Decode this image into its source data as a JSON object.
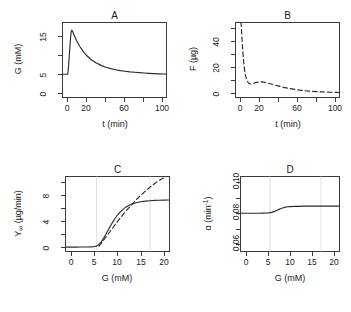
{
  "figure": {
    "label": "four-panel-simulation-figure",
    "panels_order": [
      "A",
      "B",
      "C",
      "D"
    ]
  },
  "chart_data": [
    {
      "panel": "A",
      "type": "line",
      "title": "A",
      "xlabel": "t (min)",
      "ylabel": "G (mM)",
      "xlim": [
        -6,
        104
      ],
      "ylim": [
        -1.2,
        18.6
      ],
      "xticks": [
        0,
        20,
        40,
        60,
        80,
        100
      ],
      "xticklabels": [
        "0",
        "20",
        "",
        "60",
        "",
        "100"
      ],
      "yticks": [
        0,
        5,
        10,
        15
      ],
      "yticklabels": [
        "0",
        "5",
        "",
        "15"
      ],
      "grid": false,
      "legend": "none",
      "series": [
        {
          "name": "G(t)",
          "style": "solid",
          "x": [
            -6,
            -1,
            0,
            1,
            2,
            3,
            3.6,
            4.2,
            5,
            6,
            8,
            10,
            13,
            16,
            20,
            25,
            30,
            35,
            40,
            45,
            50,
            55,
            60,
            65,
            70,
            75,
            80,
            85,
            90,
            95,
            100,
            103
          ],
          "y": [
            5.0,
            5.0,
            5.0,
            7.4,
            11.2,
            14.6,
            16.0,
            16.5,
            16.2,
            15.6,
            14.4,
            13.4,
            12.1,
            11.0,
            9.8,
            8.7,
            7.9,
            7.3,
            6.8,
            6.45,
            6.15,
            5.95,
            5.78,
            5.62,
            5.5,
            5.4,
            5.3,
            5.22,
            5.16,
            5.1,
            5.05,
            5.02
          ]
        }
      ]
    },
    {
      "panel": "B",
      "type": "line",
      "title": "B",
      "xlabel": "t (min)",
      "ylabel": "F (µg)",
      "xlim": [
        -6,
        104
      ],
      "ylim": [
        -4,
        58
      ],
      "xticks": [
        0,
        20,
        40,
        60,
        80,
        100
      ],
      "xticklabels": [
        "0",
        "20",
        "",
        "60",
        "",
        "100"
      ],
      "yticks": [
        0,
        10,
        20,
        30,
        40,
        50
      ],
      "yticklabels": [
        "0",
        "",
        "20",
        "",
        "40",
        ""
      ],
      "grid": false,
      "legend": "none",
      "note": "curve enters from above the top of the axis range",
      "series": [
        {
          "name": "F(t)",
          "style": "dashed",
          "x": [
            0.2,
            0.6,
            1.2,
            2,
            3,
            4,
            5,
            6,
            7,
            8,
            9,
            10,
            12,
            14,
            17,
            20,
            22,
            25,
            28,
            32,
            36,
            40,
            45,
            50,
            55,
            60,
            65,
            70,
            75,
            80,
            85,
            90,
            95,
            100,
            103
          ],
          "y": [
            58,
            54,
            46,
            36,
            26,
            19,
            14.5,
            11.5,
            9.6,
            8.4,
            7.7,
            7.4,
            7.6,
            8.1,
            8.8,
            9.1,
            9.1,
            8.8,
            8.3,
            7.4,
            6.5,
            5.7,
            4.7,
            3.9,
            3.2,
            2.6,
            2.1,
            1.7,
            1.4,
            1.15,
            0.95,
            0.8,
            0.65,
            0.55,
            0.5
          ]
        }
      ]
    },
    {
      "panel": "C",
      "type": "line",
      "title": "C",
      "xlabel": "G (mM)",
      "ylabel": "Y∞ (µg/min)",
      "ylabel_parts": {
        "base": "Y",
        "sub": "∞",
        "unit": " (µg/min)"
      },
      "xlim": [
        -1.3,
        21.3
      ],
      "ylim": [
        -0.7,
        10.9
      ],
      "xticks": [
        0,
        5,
        10,
        15,
        20
      ],
      "xticklabels": [
        "0",
        "5",
        "10",
        "15",
        "20"
      ],
      "yticks": [
        0,
        2,
        4,
        6,
        8,
        10
      ],
      "yticklabels": [
        "0",
        "",
        "4",
        "",
        "8",
        ""
      ],
      "grid": true,
      "gridlines_x": [
        5.5,
        17.0
      ],
      "legend": "none",
      "series": [
        {
          "name": "Y∞(G) saturating response",
          "style": "solid",
          "x": [
            -1.3,
            0,
            1,
            2,
            3,
            4,
            5,
            5.5,
            6,
            6.5,
            7,
            7.5,
            8,
            8.5,
            9,
            9.5,
            10,
            10.5,
            11,
            11.5,
            12,
            12.5,
            13,
            14,
            15,
            16,
            17,
            18,
            19,
            20,
            21
          ],
          "y": [
            0.04,
            0.05,
            0.05,
            0.06,
            0.07,
            0.09,
            0.13,
            0.2,
            0.45,
            0.85,
            1.4,
            2.0,
            2.65,
            3.3,
            3.9,
            4.45,
            4.95,
            5.35,
            5.7,
            6.0,
            6.25,
            6.45,
            6.6,
            6.82,
            6.97,
            7.06,
            7.13,
            7.17,
            7.2,
            7.22,
            7.23
          ]
        },
        {
          "name": "tangent / linear extrapolation",
          "style": "dashed",
          "x": [
            6.0,
            7,
            8,
            9,
            10,
            11,
            12,
            13,
            14,
            15,
            16,
            17,
            18,
            19,
            20,
            20.6
          ],
          "y": [
            0.2,
            1.1,
            2.05,
            3.0,
            3.95,
            4.85,
            5.7,
            6.5,
            7.25,
            7.95,
            8.6,
            9.2,
            9.75,
            10.25,
            10.65,
            10.85
          ]
        }
      ]
    },
    {
      "panel": "D",
      "type": "line",
      "title": "D",
      "xlabel": "G (mM)",
      "ylabel": "α (min⁻¹)",
      "ylabel_parts": {
        "base": "α (min",
        "sup": "-1",
        "close": ")"
      },
      "xlim": [
        -1.3,
        21.3
      ],
      "ylim": [
        0.0548,
        0.1042
      ],
      "xticks": [
        0,
        5,
        10,
        15,
        20
      ],
      "xticklabels": [
        "0",
        "5",
        "10",
        "15",
        "20"
      ],
      "yticks": [
        0.06,
        0.07,
        0.08,
        0.09,
        0.1
      ],
      "yticklabels": [
        "0.06",
        "",
        "0.08",
        "",
        "0.10"
      ],
      "grid": true,
      "gridlines_x": [
        5.5,
        17.0
      ],
      "legend": "none",
      "series": [
        {
          "name": "α(G)",
          "style": "solid",
          "x": [
            -1.3,
            0,
            1,
            2,
            3,
            4,
            5,
            5.5,
            6,
            6.5,
            7,
            7.5,
            8,
            8.5,
            9,
            9.5,
            10,
            11,
            12,
            13,
            14,
            15,
            16,
            17,
            18,
            19,
            20,
            21
          ],
          "y": [
            0.08,
            0.08,
            0.08,
            0.08,
            0.08,
            0.0801,
            0.0802,
            0.0804,
            0.0807,
            0.0812,
            0.0818,
            0.0825,
            0.0831,
            0.0836,
            0.084,
            0.0842,
            0.0843,
            0.0845,
            0.0845,
            0.0846,
            0.0846,
            0.0846,
            0.0846,
            0.0846,
            0.0846,
            0.0846,
            0.0846,
            0.0846
          ]
        }
      ]
    }
  ]
}
